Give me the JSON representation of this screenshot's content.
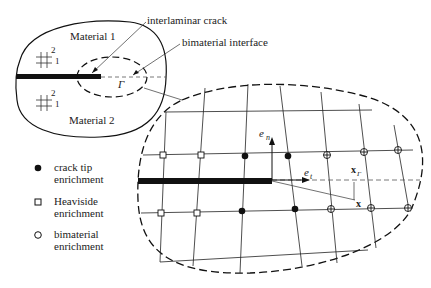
{
  "labels": {
    "material1": "Material 1",
    "material2": "Material 2",
    "interlaminar_crack": "interlaminar crack",
    "bimaterial_interface": "bimaterial interface",
    "gamma": "Γ",
    "en": "e",
    "en_sub": "n",
    "et": "e",
    "et_sub": "t",
    "xr": "x",
    "xr_sub": "Γ",
    "x": "x",
    "axis_2": "2",
    "axis_1": "1"
  },
  "legend": [
    {
      "symbol": "filled-circle",
      "line1": "crack tip",
      "line2": "enrichment"
    },
    {
      "symbol": "square",
      "line1": "Heaviside",
      "line2": "enrichment"
    },
    {
      "symbol": "open-circle",
      "line1": "bimaterial",
      "line2": "enrichment"
    }
  ],
  "colors": {
    "ink": "#111111",
    "background": "#ffffff"
  }
}
